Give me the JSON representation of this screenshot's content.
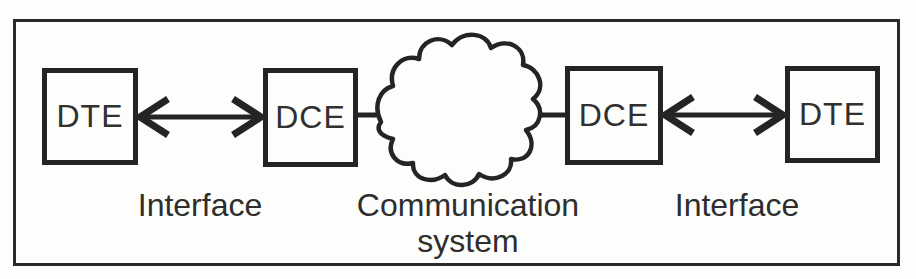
{
  "diagram": {
    "nodes": [
      {
        "id": "dte-left",
        "label": "DTE"
      },
      {
        "id": "dce-left",
        "label": "DCE"
      },
      {
        "id": "dce-right",
        "label": "DCE"
      },
      {
        "id": "dte-right",
        "label": "DTE"
      }
    ],
    "labels": {
      "interface_left": "Interface",
      "communication_line1": "Communication",
      "communication_line2": "system",
      "interface_right": "Interface"
    },
    "connections": [
      {
        "from": "dte-left",
        "to": "dce-left",
        "type": "bidirectional-arrow",
        "label": "Interface"
      },
      {
        "from": "dce-left",
        "to": "cloud",
        "type": "line"
      },
      {
        "from": "cloud",
        "to": "dce-right",
        "type": "line"
      },
      {
        "from": "dce-right",
        "to": "dte-right",
        "type": "bidirectional-arrow",
        "label": "Interface"
      }
    ],
    "colors": {
      "ink": "#242424",
      "background": "#fdfdfc"
    }
  }
}
